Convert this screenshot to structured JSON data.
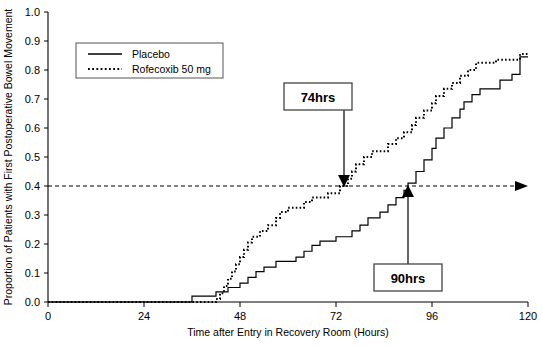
{
  "chart_data": {
    "type": "line",
    "title": "",
    "subtitle": "",
    "xlabel": "Time after Entry in Recovery Room (Hours)",
    "ylabel": "Proportion of Patients with First Postoperative Bowel Movement",
    "xlim": [
      0,
      120
    ],
    "ylim": [
      0.0,
      1.0
    ],
    "xticks": [
      0,
      24,
      48,
      72,
      96,
      120
    ],
    "xtick_labels": [
      "0",
      "24",
      "48",
      "72",
      "96",
      "120"
    ],
    "yticks": [
      0.0,
      0.1,
      0.2,
      0.3,
      0.4,
      0.5,
      0.6,
      0.7,
      0.8,
      0.9,
      1.0
    ],
    "ytick_labels": [
      "0.0",
      "0.1",
      "0.2",
      "0.3",
      "0.4",
      "0.5",
      "0.6",
      "0.7",
      "0.8",
      "0.9",
      "1.0"
    ],
    "grid": false,
    "legend_position": "upper-left-inset",
    "reference_line": {
      "orientation": "horizontal",
      "value": 0.4,
      "style": "dashed",
      "arrow_end": "right"
    },
    "annotations": [
      {
        "label": "74hrs",
        "series": "Rofecoxib 50 mg",
        "x": 74,
        "y": 0.4,
        "arrow_direction": "down"
      },
      {
        "label": "90hrs",
        "series": "Placebo",
        "x": 90,
        "y": 0.4,
        "arrow_direction": "up"
      }
    ],
    "series": [
      {
        "name": "Placebo",
        "style": "solid",
        "color": "#000000",
        "points": [
          [
            0,
            0.0
          ],
          [
            36,
            0.0
          ],
          [
            36,
            0.02
          ],
          [
            42,
            0.02
          ],
          [
            42,
            0.035
          ],
          [
            45,
            0.035
          ],
          [
            45,
            0.05
          ],
          [
            48,
            0.05
          ],
          [
            48,
            0.065
          ],
          [
            50,
            0.065
          ],
          [
            50,
            0.085
          ],
          [
            52,
            0.085
          ],
          [
            52,
            0.105
          ],
          [
            54,
            0.105
          ],
          [
            54,
            0.12
          ],
          [
            57,
            0.12
          ],
          [
            57,
            0.14
          ],
          [
            62,
            0.14
          ],
          [
            62,
            0.155
          ],
          [
            64,
            0.155
          ],
          [
            64,
            0.175
          ],
          [
            66,
            0.175
          ],
          [
            66,
            0.195
          ],
          [
            68,
            0.195
          ],
          [
            68,
            0.21
          ],
          [
            72,
            0.21
          ],
          [
            72,
            0.225
          ],
          [
            76,
            0.225
          ],
          [
            76,
            0.245
          ],
          [
            78,
            0.245
          ],
          [
            78,
            0.265
          ],
          [
            80,
            0.265
          ],
          [
            80,
            0.29
          ],
          [
            83,
            0.29
          ],
          [
            83,
            0.31
          ],
          [
            85,
            0.31
          ],
          [
            85,
            0.335
          ],
          [
            87,
            0.335
          ],
          [
            87,
            0.36
          ],
          [
            89,
            0.36
          ],
          [
            89,
            0.385
          ],
          [
            90,
            0.385
          ],
          [
            90,
            0.41
          ],
          [
            92,
            0.41
          ],
          [
            92,
            0.45
          ],
          [
            94,
            0.45
          ],
          [
            94,
            0.49
          ],
          [
            96,
            0.49
          ],
          [
            96,
            0.53
          ],
          [
            97,
            0.53
          ],
          [
            97,
            0.565
          ],
          [
            99,
            0.565
          ],
          [
            99,
            0.6
          ],
          [
            101,
            0.6
          ],
          [
            101,
            0.635
          ],
          [
            103,
            0.635
          ],
          [
            103,
            0.665
          ],
          [
            104,
            0.665
          ],
          [
            104,
            0.69
          ],
          [
            106,
            0.69
          ],
          [
            106,
            0.715
          ],
          [
            108,
            0.715
          ],
          [
            108,
            0.735
          ],
          [
            113,
            0.735
          ],
          [
            113,
            0.765
          ],
          [
            116,
            0.765
          ],
          [
            116,
            0.785
          ],
          [
            118,
            0.785
          ],
          [
            118,
            0.845
          ],
          [
            120,
            0.845
          ]
        ]
      },
      {
        "name": "Rofecoxib 50 mg",
        "style": "dotted",
        "color": "#000000",
        "points": [
          [
            0,
            0.0
          ],
          [
            42,
            0.0
          ],
          [
            42,
            0.01
          ],
          [
            43,
            0.01
          ],
          [
            43,
            0.03
          ],
          [
            44,
            0.03
          ],
          [
            44,
            0.055
          ],
          [
            45,
            0.055
          ],
          [
            45,
            0.08
          ],
          [
            46,
            0.08
          ],
          [
            46,
            0.105
          ],
          [
            47,
            0.105
          ],
          [
            47,
            0.13
          ],
          [
            48,
            0.13
          ],
          [
            48,
            0.155
          ],
          [
            49,
            0.155
          ],
          [
            49,
            0.18
          ],
          [
            50,
            0.18
          ],
          [
            50,
            0.205
          ],
          [
            51,
            0.205
          ],
          [
            51,
            0.225
          ],
          [
            53,
            0.225
          ],
          [
            53,
            0.245
          ],
          [
            55,
            0.245
          ],
          [
            55,
            0.265
          ],
          [
            57,
            0.265
          ],
          [
            57,
            0.29
          ],
          [
            58,
            0.29
          ],
          [
            58,
            0.31
          ],
          [
            60,
            0.31
          ],
          [
            60,
            0.325
          ],
          [
            64,
            0.325
          ],
          [
            64,
            0.345
          ],
          [
            66,
            0.345
          ],
          [
            66,
            0.36
          ],
          [
            70,
            0.36
          ],
          [
            70,
            0.375
          ],
          [
            73,
            0.375
          ],
          [
            73,
            0.4
          ],
          [
            75,
            0.4
          ],
          [
            75,
            0.425
          ],
          [
            76,
            0.425
          ],
          [
            76,
            0.45
          ],
          [
            77,
            0.45
          ],
          [
            77,
            0.475
          ],
          [
            79,
            0.475
          ],
          [
            79,
            0.5
          ],
          [
            81,
            0.5
          ],
          [
            81,
            0.52
          ],
          [
            85,
            0.52
          ],
          [
            85,
            0.545
          ],
          [
            87,
            0.545
          ],
          [
            87,
            0.565
          ],
          [
            89,
            0.565
          ],
          [
            89,
            0.585
          ],
          [
            91,
            0.585
          ],
          [
            91,
            0.61
          ],
          [
            92,
            0.61
          ],
          [
            92,
            0.635
          ],
          [
            94,
            0.635
          ],
          [
            94,
            0.66
          ],
          [
            96,
            0.66
          ],
          [
            96,
            0.685
          ],
          [
            97,
            0.685
          ],
          [
            97,
            0.71
          ],
          [
            99,
            0.71
          ],
          [
            99,
            0.735
          ],
          [
            101,
            0.735
          ],
          [
            101,
            0.755
          ],
          [
            103,
            0.755
          ],
          [
            103,
            0.78
          ],
          [
            105,
            0.78
          ],
          [
            105,
            0.8
          ],
          [
            107,
            0.8
          ],
          [
            107,
            0.825
          ],
          [
            112,
            0.825
          ],
          [
            112,
            0.835
          ],
          [
            118,
            0.835
          ],
          [
            118,
            0.855
          ],
          [
            120,
            0.855
          ]
        ]
      }
    ]
  },
  "legend": {
    "items": [
      {
        "label": "Placebo",
        "style": "solid"
      },
      {
        "label": "Rofecoxib 50 mg",
        "style": "dotted"
      }
    ]
  }
}
